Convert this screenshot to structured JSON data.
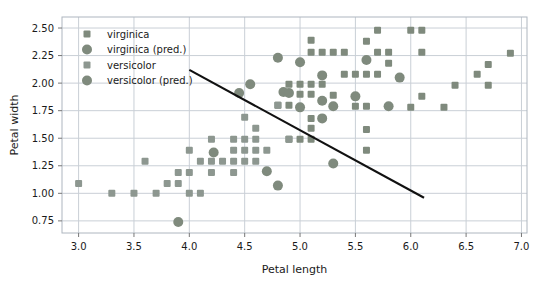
{
  "chart_data": {
    "type": "scatter",
    "title": "",
    "xlabel": "Petal length",
    "ylabel": "Petal width",
    "xlim": [
      2.85,
      7.05
    ],
    "ylim": [
      0.64,
      2.6
    ],
    "xticks": [
      "3.0",
      "3.5",
      "4.0",
      "4.5",
      "5.0",
      "5.5",
      "6.0",
      "6.5",
      "7.0"
    ],
    "xtick_values": [
      3.0,
      3.5,
      4.0,
      4.5,
      5.0,
      5.5,
      6.0,
      6.5,
      7.0
    ],
    "yticks": [
      "0.75",
      "1.00",
      "1.25",
      "1.50",
      "1.75",
      "2.00",
      "2.25",
      "2.50"
    ],
    "ytick_values": [
      0.75,
      1.0,
      1.25,
      1.5,
      1.75,
      2.0,
      2.25,
      2.5
    ],
    "grid": true,
    "legend_position": "upper-left",
    "marker_color": "#7f8a7d",
    "line_color": "#111111",
    "grid_color": "#c9cfd6",
    "frame_color": "#aeb6bf",
    "series": [
      {
        "name": "virginica",
        "marker": "square",
        "size": 7,
        "color": "#7f8a7d",
        "points": [
          [
            5.1,
            2.39
          ],
          [
            5.7,
            2.48
          ],
          [
            6.0,
            2.48
          ],
          [
            6.1,
            2.48
          ],
          [
            6.9,
            2.27
          ],
          [
            5.1,
            2.28
          ],
          [
            5.2,
            2.28
          ],
          [
            5.3,
            2.28
          ],
          [
            5.4,
            2.28
          ],
          [
            5.7,
            2.28
          ],
          [
            5.8,
            2.28
          ],
          [
            6.1,
            2.28
          ],
          [
            5.6,
            2.38
          ],
          [
            5.4,
            2.08
          ],
          [
            5.5,
            2.08
          ],
          [
            5.6,
            2.08
          ],
          [
            5.7,
            2.08
          ],
          [
            5.9,
            2.05
          ],
          [
            6.6,
            2.08
          ],
          [
            6.7,
            2.17
          ],
          [
            5.8,
            2.18
          ],
          [
            6.4,
            1.98
          ],
          [
            6.7,
            1.98
          ],
          [
            4.9,
            1.99
          ],
          [
            5.0,
            1.99
          ],
          [
            5.1,
            1.99
          ],
          [
            5.2,
            1.99
          ],
          [
            5.0,
            1.9
          ],
          [
            5.1,
            1.9
          ],
          [
            5.3,
            1.89
          ],
          [
            6.1,
            1.88
          ],
          [
            5.5,
            1.79
          ],
          [
            5.6,
            1.79
          ],
          [
            6.0,
            1.78
          ],
          [
            6.3,
            1.78
          ],
          [
            4.8,
            1.8
          ],
          [
            4.9,
            1.8
          ],
          [
            5.1,
            1.68
          ],
          [
            5.1,
            1.59
          ],
          [
            5.6,
            1.58
          ],
          [
            4.9,
            1.49
          ],
          [
            5.0,
            1.49
          ],
          [
            5.1,
            1.49
          ],
          [
            5.6,
            1.39
          ]
        ]
      },
      {
        "name": "virginica (pred.)",
        "marker": "circle",
        "size": 10,
        "color": "#7f8a7d",
        "points": [
          [
            4.8,
            2.23
          ],
          [
            5.0,
            2.19
          ],
          [
            5.6,
            2.21
          ],
          [
            5.2,
            2.07
          ],
          [
            5.9,
            2.05
          ],
          [
            4.85,
            1.92
          ],
          [
            4.9,
            1.91
          ],
          [
            5.5,
            1.88
          ],
          [
            5.2,
            1.84
          ],
          [
            5.0,
            1.78
          ],
          [
            5.3,
            1.79
          ],
          [
            5.8,
            1.79
          ],
          [
            5.2,
            1.68
          ],
          [
            5.3,
            1.27
          ]
        ]
      },
      {
        "name": "versicolor",
        "marker": "square",
        "size": 7,
        "color": "#8d9790",
        "points": [
          [
            4.5,
            1.69
          ],
          [
            4.6,
            1.59
          ],
          [
            4.4,
            1.49
          ],
          [
            4.5,
            1.49
          ],
          [
            4.6,
            1.49
          ],
          [
            4.2,
            1.49
          ],
          [
            4.0,
            1.39
          ],
          [
            4.4,
            1.39
          ],
          [
            4.6,
            1.39
          ],
          [
            4.7,
            1.39
          ],
          [
            4.5,
            1.39
          ],
          [
            3.6,
            1.29
          ],
          [
            4.1,
            1.29
          ],
          [
            4.2,
            1.29
          ],
          [
            4.3,
            1.29
          ],
          [
            4.4,
            1.29
          ],
          [
            4.5,
            1.29
          ],
          [
            4.6,
            1.29
          ],
          [
            3.9,
            1.19
          ],
          [
            4.0,
            1.19
          ],
          [
            4.2,
            1.19
          ],
          [
            4.4,
            1.19
          ],
          [
            3.8,
            1.09
          ],
          [
            3.9,
            1.09
          ],
          [
            3.0,
            1.09
          ],
          [
            3.3,
            1.0
          ],
          [
            3.5,
            1.0
          ],
          [
            3.7,
            1.0
          ],
          [
            4.0,
            1.0
          ],
          [
            4.1,
            1.0
          ],
          [
            4.8,
            1.8
          ],
          [
            4.9,
            1.49
          ]
        ]
      },
      {
        "name": "versicolor (pred.)",
        "marker": "circle",
        "size": 10,
        "color": "#7f8a7d",
        "points": [
          [
            4.45,
            1.91
          ],
          [
            4.55,
            1.99
          ],
          [
            4.22,
            1.37
          ],
          [
            4.7,
            1.2
          ],
          [
            4.8,
            1.07
          ],
          [
            3.9,
            0.74
          ]
        ]
      }
    ],
    "decision_boundary": {
      "name": "decision boundary",
      "x": [
        4.0,
        6.12
      ],
      "y": [
        2.12,
        0.96
      ],
      "color": "#111111",
      "width": 2.1
    }
  },
  "legend": {
    "items": [
      {
        "label": "virginica",
        "marker": "square",
        "size": 7,
        "color": "#7f8a7d"
      },
      {
        "label": "virginica (pred.)",
        "marker": "circle",
        "size": 10,
        "color": "#7f8a7d"
      },
      {
        "label": "versicolor",
        "marker": "square",
        "size": 7,
        "color": "#8d9790"
      },
      {
        "label": "versicolor (pred.)",
        "marker": "circle",
        "size": 10,
        "color": "#7f8a7d"
      }
    ]
  }
}
